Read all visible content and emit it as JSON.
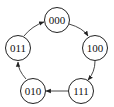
{
  "diagram": {
    "type": "state-cycle",
    "nodes": [
      {
        "id": "n0",
        "label": "000"
      },
      {
        "id": "n1",
        "label": "100"
      },
      {
        "id": "n2",
        "label": "111"
      },
      {
        "id": "n3",
        "label": "010"
      },
      {
        "id": "n4",
        "label": "011"
      }
    ],
    "edges": [
      {
        "from": "000",
        "to": "100"
      },
      {
        "from": "100",
        "to": "111"
      },
      {
        "from": "111",
        "to": "010"
      },
      {
        "from": "010",
        "to": "011"
      },
      {
        "from": "011",
        "to": "000"
      }
    ]
  }
}
